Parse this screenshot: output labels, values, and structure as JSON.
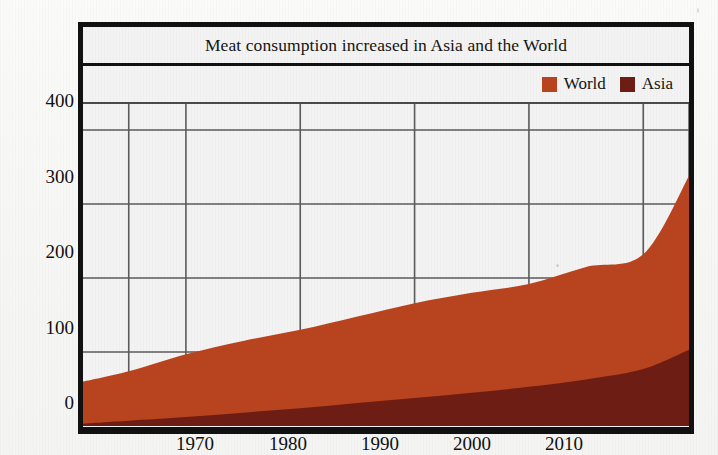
{
  "chart_data": {
    "type": "area",
    "stacked": true,
    "title": "Meat consumption increased in Asia and the World",
    "xlabel": "",
    "ylabel": "",
    "xlim": [
      1961,
      2014
    ],
    "ylim": [
      0,
      430
    ],
    "grid": true,
    "legend_position": "top-right",
    "xticks": [
      1970,
      1980,
      1990,
      2000,
      2010
    ],
    "yticks": [
      0,
      100,
      200,
      300,
      400
    ],
    "x": [
      1961,
      1965,
      1970,
      1975,
      1980,
      1985,
      1990,
      1995,
      2000,
      2005,
      2010,
      2014
    ],
    "series": [
      {
        "name": "World",
        "color": "#b8431f",
        "values": [
          60,
          74,
          97,
          115,
          130,
          148,
          166,
          180,
          192,
          215,
          232,
          338
        ]
      },
      {
        "name": "Asia",
        "color": "#6d1d14",
        "values": [
          3,
          7,
          12,
          18,
          24,
          31,
          38,
          45,
          53,
          63,
          77,
          103
        ]
      }
    ]
  },
  "figure": {
    "title": "Meat consumption increased in Asia and the World",
    "legend": [
      {
        "label": "World",
        "color": "#b8431f"
      },
      {
        "label": "Asia",
        "color": "#6d1d14"
      }
    ],
    "y_axis": {
      "ticks": [
        {
          "label": "400",
          "value": 400
        },
        {
          "label": "300",
          "value": 300
        },
        {
          "label": "200",
          "value": 200
        },
        {
          "label": "100",
          "value": 100
        },
        {
          "label": "0",
          "value": 0
        }
      ]
    },
    "x_axis": {
      "ticks": [
        {
          "label": "1970",
          "value": 1970
        },
        {
          "label": "1980",
          "value": 1980
        },
        {
          "label": "1990",
          "value": 1990
        },
        {
          "label": "2000",
          "value": 2000
        },
        {
          "label": "2010",
          "value": 2010
        }
      ]
    },
    "colors": {
      "frame": "#111111",
      "grid": "#5a5a5a",
      "plot_background": "#f2f3f2",
      "page_background": "#f7f7f6"
    }
  }
}
